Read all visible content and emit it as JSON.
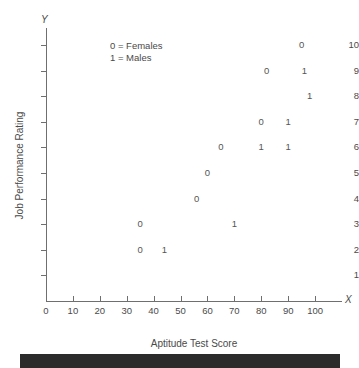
{
  "chart_data": {
    "type": "scatter",
    "title": "",
    "xlabel": "Aptitude Test Score",
    "ylabel": "Job Performance Rating",
    "x_axis_marker": "X",
    "y_axis_marker": "Y",
    "xlim": [
      0,
      110
    ],
    "ylim": [
      0,
      10.6
    ],
    "xticks": [
      0,
      10,
      20,
      30,
      40,
      50,
      60,
      70,
      80,
      90,
      100
    ],
    "yticks": [
      1,
      2,
      3,
      4,
      5,
      6,
      7,
      8,
      9,
      10
    ],
    "grid": false,
    "legend_position": "upper-left-inside",
    "legend": [
      {
        "marker": "0",
        "label": "0 = Females"
      },
      {
        "marker": "1",
        "label": "1 = Males"
      }
    ],
    "point_marker_style": "digit-glyph",
    "series": [
      {
        "name": "Females",
        "marker": "0",
        "points": [
          {
            "x": 35,
            "y": 2,
            "label": "0"
          },
          {
            "x": 35,
            "y": 3,
            "label": "0"
          },
          {
            "x": 56,
            "y": 4,
            "label": "0"
          },
          {
            "x": 60,
            "y": 5,
            "label": "0"
          },
          {
            "x": 65,
            "y": 6,
            "label": "0"
          },
          {
            "x": 80,
            "y": 7,
            "label": "0"
          },
          {
            "x": 82,
            "y": 9,
            "label": "0"
          },
          {
            "x": 95,
            "y": 10,
            "label": "0"
          }
        ]
      },
      {
        "name": "Males",
        "marker": "1",
        "points": [
          {
            "x": 44,
            "y": 2,
            "label": "1"
          },
          {
            "x": 70,
            "y": 3,
            "label": "1"
          },
          {
            "x": 80,
            "y": 6,
            "label": "1"
          },
          {
            "x": 90,
            "y": 6,
            "label": "1"
          },
          {
            "x": 90,
            "y": 7,
            "label": "1"
          },
          {
            "x": 98,
            "y": 8,
            "label": "1"
          },
          {
            "x": 96,
            "y": 9,
            "label": "1"
          }
        ]
      }
    ],
    "all_points": [
      {
        "x": 35,
        "y": 3,
        "label": "0",
        "group": "Females"
      },
      {
        "x": 35,
        "y": 2,
        "label": "0",
        "group": "Females"
      },
      {
        "x": 44,
        "y": 2,
        "label": "1",
        "group": "Males"
      },
      {
        "x": 56,
        "y": 4,
        "label": "0",
        "group": "Females"
      },
      {
        "x": 60,
        "y": 5,
        "label": "0",
        "group": "Females"
      },
      {
        "x": 65,
        "y": 6,
        "label": "0",
        "group": "Females"
      },
      {
        "x": 70,
        "y": 3,
        "label": "1",
        "group": "Males"
      },
      {
        "x": 80,
        "y": 7,
        "label": "0",
        "group": "Females"
      },
      {
        "x": 80,
        "y": 6,
        "label": "1",
        "group": "Males"
      },
      {
        "x": 82,
        "y": 9,
        "label": "0",
        "group": "Females"
      },
      {
        "x": 90,
        "y": 7,
        "label": "1",
        "group": "Males"
      },
      {
        "x": 90,
        "y": 6,
        "label": "1",
        "group": "Males"
      },
      {
        "x": 95,
        "y": 10,
        "label": "0",
        "group": "Females"
      },
      {
        "x": 96,
        "y": 9,
        "label": "1",
        "group": "Males"
      },
      {
        "x": 98,
        "y": 8,
        "label": "1",
        "group": "Males"
      }
    ]
  },
  "colors": {
    "axis": "#6f6f6f",
    "text": "#4a4a4a",
    "point": "#555555",
    "background": "#ffffff",
    "band": "#2b2b2b"
  }
}
